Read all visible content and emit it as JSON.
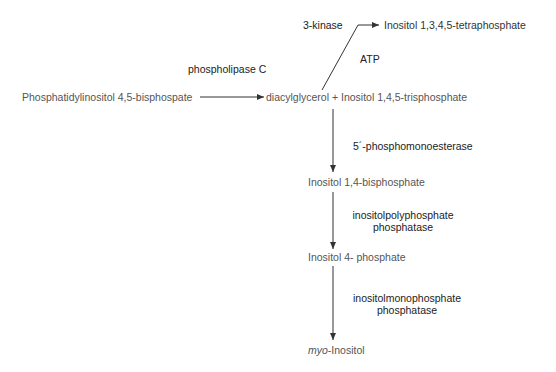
{
  "diagram": {
    "compounds": {
      "substrate": "Phosphatidylinositol 4,5-bisphospate",
      "products": "diacylglycerol + Inositol 1,4,5-trisphosphate",
      "tetraphosphate": "Inositol 1,3,4,5-tetraphosphate",
      "bisphosphate": "Inositol 1,4-bisphosphate",
      "monophosphate": "Inositol 4- phosphate",
      "final_prefix": "myo",
      "final_suffix": "-Inositol"
    },
    "enzymes": {
      "plc": "phospholipase C",
      "kinase": "3-kinase",
      "kinase_cofactor": "ATP",
      "phosphomonoesterase": "5´-phosphomonoesterase",
      "polyphosphatase_line1": "inositolpolyphosphate",
      "polyphosphatase_line2": "phosphatase",
      "monophosphatase_line1": "inositolmonophosphate",
      "monophosphatase_line2": "phosphatase"
    },
    "edges": [
      {
        "from": "substrate",
        "to": "products",
        "enzyme": "plc"
      },
      {
        "from": "products",
        "to": "tetraphosphate",
        "enzyme": "kinase",
        "cofactor": "kinase_cofactor"
      },
      {
        "from": "products",
        "to": "bisphosphate",
        "enzyme": "phosphomonoesterase"
      },
      {
        "from": "bisphosphate",
        "to": "monophosphate",
        "enzyme": "polyphosphatase"
      },
      {
        "from": "monophosphate",
        "to": "final",
        "enzyme": "monophosphatase"
      }
    ],
    "colors": {
      "text": "#333333",
      "lines": "#333333",
      "background": "#ffffff"
    }
  }
}
